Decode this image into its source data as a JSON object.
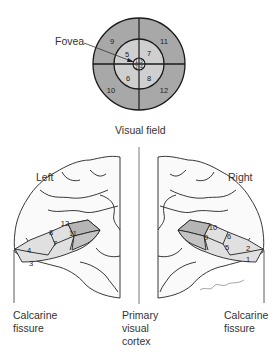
{
  "visual_field": {
    "title": "Visual field",
    "fovea_label": "Fovea",
    "outer_sectors": [
      "9",
      "11",
      "10",
      "12"
    ],
    "middle_sectors": [
      "5",
      "7",
      "6",
      "8"
    ],
    "fovea_sectors": [
      "1",
      "3",
      "2",
      "4"
    ],
    "colors": {
      "outer": "#a8a8a8",
      "middle": "#cfcfcf",
      "fovea": "#e6e6e6",
      "stroke": "#1a1a1a"
    }
  },
  "left_hemisphere": {
    "label": "Left",
    "regions": [
      "4",
      "3",
      "8",
      "7",
      "12",
      "11"
    ]
  },
  "right_hemisphere": {
    "label": "Right",
    "regions": [
      "10",
      "9",
      "6",
      "5",
      "2",
      "1"
    ]
  },
  "captions": {
    "left_fissure_line1": "Calcarine",
    "left_fissure_line2": "fissure",
    "center_line1": "Primary",
    "center_line2": "visual",
    "center_line3": "cortex",
    "right_fissure_line1": "Calcarine",
    "right_fissure_line2": "fissure"
  }
}
